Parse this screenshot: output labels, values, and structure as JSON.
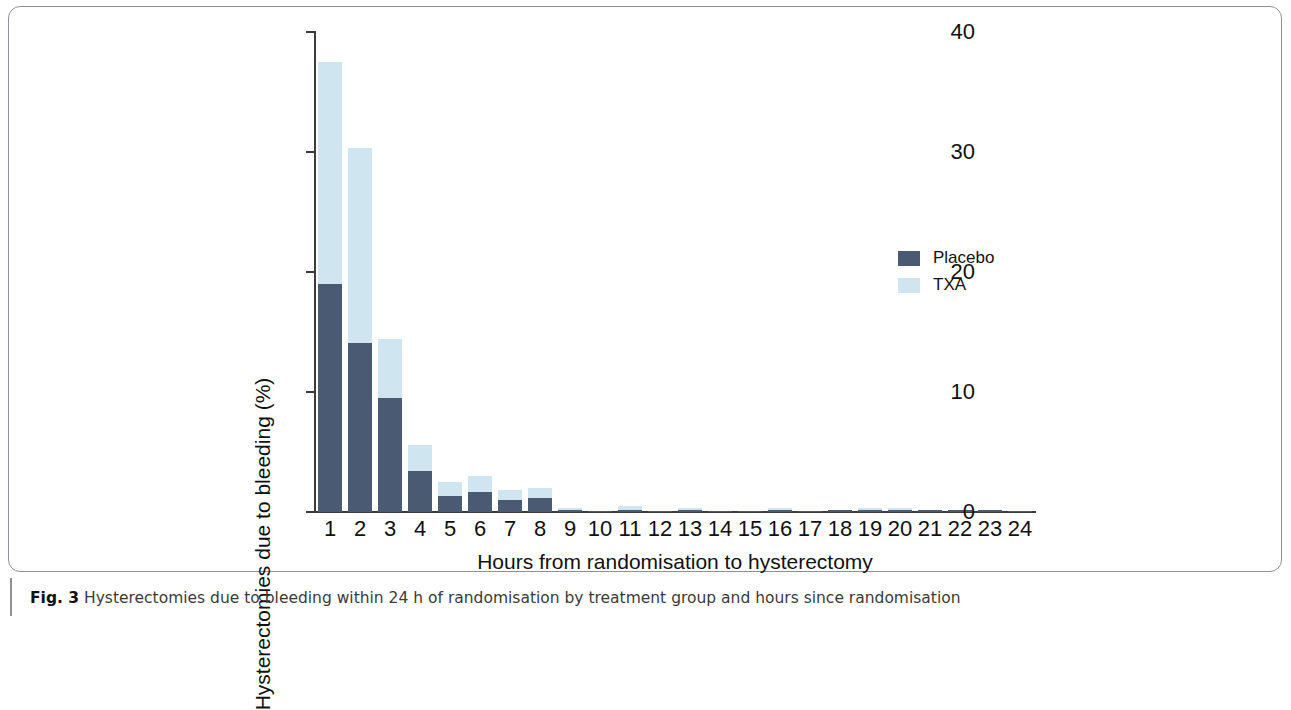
{
  "figure": {
    "caption_number": "Fig. 3",
    "caption_text": " Hysterectomies due to bleeding within 24 h of randomisation by treatment group and hours since randomisation"
  },
  "colors": {
    "placebo": "#4a5a73",
    "txa": "#cfe5f0",
    "axis": "#3c3c3c",
    "frame": "#8d9299"
  },
  "chart_data": {
    "type": "bar",
    "title": "",
    "xlabel": "Hours from randomisation to hysterectomy",
    "ylabel": "Hysterectomies due to bleeding (%)",
    "categories": [
      "1",
      "2",
      "3",
      "4",
      "5",
      "6",
      "7",
      "8",
      "9",
      "10",
      "11",
      "12",
      "13",
      "14",
      "15",
      "16",
      "17",
      "18",
      "19",
      "20",
      "21",
      "22",
      "23",
      "24"
    ],
    "ylim": [
      0,
      40
    ],
    "yticks": [
      "0",
      "10",
      "20",
      "30",
      "40"
    ],
    "ytick_values": [
      0,
      10,
      20,
      30,
      40
    ],
    "grid": false,
    "bar_mode": "overlay",
    "legend_position": "right",
    "series": [
      {
        "name": "TXA",
        "color": "#cfe5f0",
        "values": [
          37.5,
          30.3,
          14.4,
          5.6,
          2.5,
          3.0,
          1.8,
          2.0,
          0.3,
          0.1,
          0.5,
          0.1,
          0.3,
          0.1,
          0.1,
          0.3,
          0.1,
          0.2,
          0.3,
          0.3,
          0.2,
          0.2,
          0.2,
          0.1
        ]
      },
      {
        "name": "Placebo",
        "color": "#4a5a73",
        "values": [
          19.0,
          14.1,
          9.5,
          3.4,
          1.3,
          1.7,
          1.0,
          1.2,
          0.2,
          0.1,
          0.2,
          0.1,
          0.2,
          0.1,
          0.1,
          0.2,
          0.1,
          0.2,
          0.2,
          0.2,
          0.2,
          0.2,
          0.2,
          0.1
        ]
      }
    ],
    "legend": [
      "Placebo",
      "TXA"
    ]
  }
}
